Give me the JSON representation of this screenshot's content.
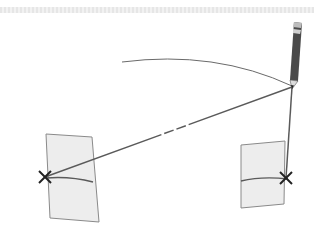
{
  "diagram": {
    "type": "geometric-construction",
    "colors": {
      "background": "#ffffff",
      "paper_fill": "#ededed",
      "paper_stroke": "#8a8a8a",
      "line": "#5a5a5a",
      "pencil_body": "#4a4a4a",
      "mark": "#222222"
    },
    "pencil": {
      "tip": [
        292,
        87
      ],
      "top": [
        298,
        22
      ]
    },
    "arc": {
      "start": [
        122,
        62
      ],
      "end": [
        292,
        86
      ]
    },
    "left_sheet": {
      "corners": [
        [
          46,
          134
        ],
        [
          92,
          137
        ],
        [
          99,
          222
        ],
        [
          50,
          218
        ]
      ],
      "mark": [
        45,
        177
      ]
    },
    "right_sheet": {
      "corners": [
        [
          241,
          145
        ],
        [
          285,
          141
        ],
        [
          284,
          204
        ],
        [
          241,
          208
        ]
      ],
      "mark": [
        286,
        178
      ]
    },
    "marks": [
      {
        "name": "left-cross",
        "point": [
          45,
          177
        ]
      },
      {
        "name": "right-cross",
        "point": [
          286,
          178
        ]
      }
    ]
  }
}
